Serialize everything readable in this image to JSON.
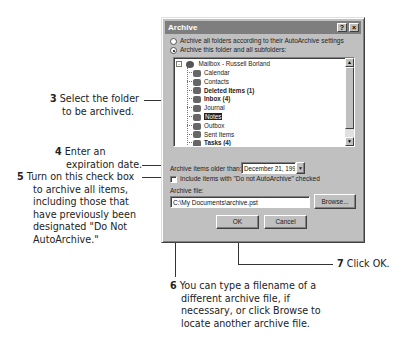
{
  "dialog": {
    "title": "Archive",
    "help_button": "?",
    "close_button": "×",
    "radio_all": "Archive all folders according to their AutoArchive settings",
    "radio_this": "Archive this folder and all subfolders:",
    "radio_selected": "this",
    "tree": {
      "root": "Mailbox - Russell Borland",
      "items": [
        {
          "label": "Calendar",
          "bold": false,
          "selected": false,
          "icon": "calendar-folder-icon"
        },
        {
          "label": "Contacts",
          "bold": false,
          "selected": false,
          "icon": "contacts-folder-icon"
        },
        {
          "label": "Deleted Items (1)",
          "bold": true,
          "selected": false,
          "icon": "deleted-items-folder-icon"
        },
        {
          "label": "Inbox (4)",
          "bold": true,
          "selected": false,
          "icon": "inbox-folder-icon"
        },
        {
          "label": "Journal",
          "bold": false,
          "selected": false,
          "icon": "journal-folder-icon"
        },
        {
          "label": "Notes",
          "bold": false,
          "selected": true,
          "icon": "notes-folder-icon"
        },
        {
          "label": "Outbox",
          "bold": false,
          "selected": false,
          "icon": "outbox-folder-icon"
        },
        {
          "label": "Sent Items",
          "bold": false,
          "selected": false,
          "icon": "sent-items-folder-icon"
        },
        {
          "label": "Tasks (4)",
          "bold": true,
          "selected": false,
          "icon": "tasks-folder-icon"
        }
      ]
    },
    "older_than_label": "Archive items older than:",
    "older_than_value": "December 21, 1996",
    "include_checkbox_label": "Include items with \"Do not AutoArchive\" checked",
    "include_checked": false,
    "archive_file_label": "Archive file:",
    "archive_file_value": "C:\\My Documents\\archive.pst",
    "browse_button": "Browse...",
    "ok_button": "OK",
    "cancel_button": "Cancel"
  },
  "callouts": {
    "c3": {
      "num": "3",
      "lines": [
        "Select the folder",
        "to be archived."
      ]
    },
    "c4": {
      "num": "4",
      "lines": [
        "Enter an",
        "expiration date."
      ]
    },
    "c5": {
      "num": "5",
      "lines": [
        "Turn on this check box",
        "to archive all items,",
        "including those that",
        "have previously been",
        "designated \"Do Not",
        "AutoArchive.\""
      ]
    },
    "c6": {
      "num": "6",
      "lines": [
        "You can type a filename of a",
        "different archive file, if",
        "necessary, or click Browse to",
        "locate another archive file."
      ]
    },
    "c7": {
      "num": "7",
      "lines": [
        "Click OK."
      ]
    }
  }
}
